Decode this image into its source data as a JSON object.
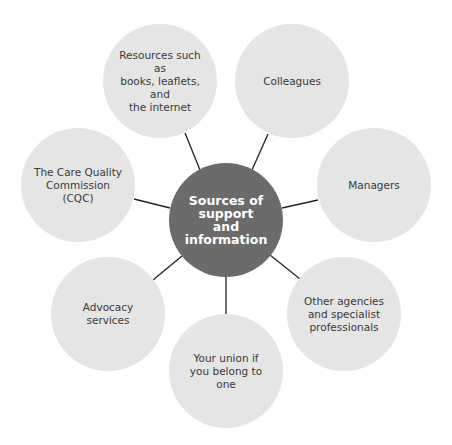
{
  "diagram": {
    "type": "hub-and-spoke",
    "colors": {
      "center_fill": "#6b6b6b",
      "center_text": "#ffffff",
      "node_fill": "#e5e5e5",
      "node_text": "#3a3a3a",
      "connector": "#222222"
    },
    "center": {
      "label": "Sources of\nsupport\nand information"
    },
    "nodes": [
      {
        "id": "resources",
        "label": "Resources such as\nbooks, leaflets, and\nthe internet"
      },
      {
        "id": "colleagues",
        "label": "Colleagues"
      },
      {
        "id": "managers",
        "label": "Managers"
      },
      {
        "id": "other-agencies",
        "label": "Other agencies\nand specialist\nprofessionals"
      },
      {
        "id": "union",
        "label": "Your union if\nyou belong to one"
      },
      {
        "id": "advocacy",
        "label": "Advocacy services"
      },
      {
        "id": "cqc",
        "label": "The Care Quality\nCommission (CQC)"
      }
    ]
  }
}
